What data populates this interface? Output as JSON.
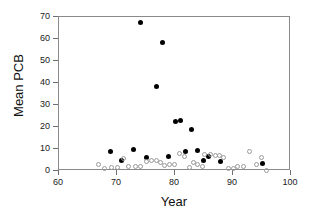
{
  "chart_data": {
    "type": "scatter",
    "title": "",
    "xlabel": "Year",
    "ylabel": "Mean PCB",
    "xlim": [
      60,
      100
    ],
    "ylim": [
      0,
      70
    ],
    "xticks": [
      60,
      70,
      80,
      90,
      100
    ],
    "yticks": [
      0,
      10,
      20,
      30,
      40,
      50,
      60,
      70
    ],
    "grid": false,
    "legend": "none",
    "series": [
      {
        "name": "filled-circles",
        "marker": "filled-circle",
        "color": "#000000",
        "points": [
          [
            69.0,
            8.3
          ],
          [
            71.0,
            4.4
          ],
          [
            73.0,
            9.5
          ],
          [
            74.2,
            67.0
          ],
          [
            75.2,
            5.7
          ],
          [
            77.0,
            37.8
          ],
          [
            78.0,
            57.8
          ],
          [
            79.0,
            6.1
          ],
          [
            80.2,
            22.0
          ],
          [
            81.2,
            22.3
          ],
          [
            82.0,
            8.4
          ],
          [
            83.0,
            18.5
          ],
          [
            84.0,
            8.8
          ],
          [
            85.0,
            4.5
          ],
          [
            86.0,
            6.0
          ],
          [
            88.0,
            3.9
          ],
          [
            95.3,
            2.9
          ]
        ]
      },
      {
        "name": "open-circles",
        "marker": "open-circle",
        "color": "#9a9a9a",
        "points": [
          [
            67.0,
            2.5
          ],
          [
            68.0,
            0.7
          ],
          [
            69.2,
            1.3
          ],
          [
            70.2,
            1.2
          ],
          [
            71.3,
            5.2
          ],
          [
            72.2,
            1.5
          ],
          [
            73.3,
            1.7
          ],
          [
            74.3,
            1.6
          ],
          [
            75.3,
            4.0
          ],
          [
            76.1,
            4.4
          ],
          [
            76.9,
            4.5
          ],
          [
            77.6,
            3.5
          ],
          [
            78.4,
            2.0
          ],
          [
            79.2,
            2.4
          ],
          [
            80.0,
            2.6
          ],
          [
            81.0,
            7.7
          ],
          [
            81.8,
            6.3
          ],
          [
            82.6,
            1.3
          ],
          [
            83.3,
            3.4
          ],
          [
            84.1,
            2.6
          ],
          [
            84.9,
            1.6
          ],
          [
            85.3,
            7.0
          ],
          [
            86.3,
            7.0
          ],
          [
            87.2,
            6.8
          ],
          [
            87.9,
            6.7
          ],
          [
            88.6,
            5.9
          ],
          [
            89.4,
            0.8
          ],
          [
            90.2,
            0.9
          ],
          [
            91.0,
            1.4
          ],
          [
            92.0,
            1.6
          ],
          [
            93.0,
            8.2
          ],
          [
            94.2,
            2.3
          ],
          [
            95.0,
            5.6
          ],
          [
            96.0,
            0.0
          ]
        ]
      }
    ]
  }
}
